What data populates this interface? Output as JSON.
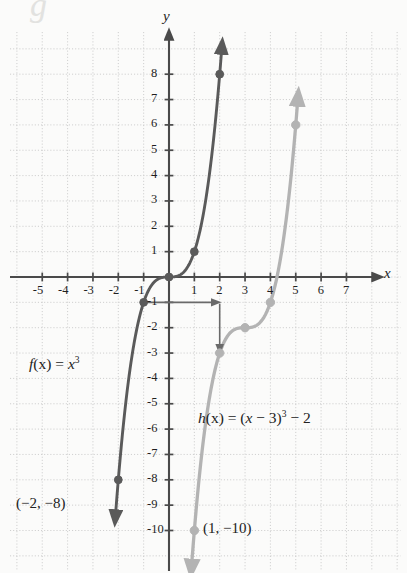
{
  "figure": {
    "axis_labels": {
      "x": "x",
      "y": "y"
    },
    "x_ticks": [
      "-5",
      "-4",
      "-3",
      "-2",
      "-1",
      "1",
      "2",
      "3",
      "4",
      "5",
      "6",
      "7"
    ],
    "y_ticks": [
      "8",
      "7",
      "6",
      "5",
      "4",
      "3",
      "2",
      "1",
      "-1",
      "-2",
      "-3",
      "-4",
      "-5",
      "-6",
      "-7",
      "-8",
      "-9",
      "-10"
    ],
    "function_labels": {
      "f_name": "f",
      "f_arg": "(x) = ",
      "f_base": "x",
      "f_exp": "3",
      "h_name": "h",
      "h_arg": "(x) = (",
      "h_var": "x",
      "h_mid": " − 3)",
      "h_exp": "3",
      "h_tail": " − 2"
    },
    "point_labels": {
      "f_endpoint": "(−2, −8)",
      "h_endpoint": "(1, −10)"
    },
    "colors": {
      "f_curve": "#5a5a5a",
      "h_curve": "#b3b3b3",
      "axis": "#4a4a4a",
      "grid": "#c9c9c9",
      "transform_arrow": "#6a6a6a"
    }
  },
  "chart_data": {
    "type": "line",
    "title": "",
    "xlabel": "x",
    "ylabel": "y",
    "xlim": [
      -6.3,
      7.9
    ],
    "ylim": [
      -10.8,
      9.1
    ],
    "grid": true,
    "legend": "inline-annotations",
    "series": [
      {
        "name": "f(x) = x^3",
        "color": "#5a5a5a",
        "marked_points": [
          {
            "x": -2,
            "y": -8,
            "label": "(-2, -8)"
          },
          {
            "x": -1,
            "y": -1,
            "label": ""
          },
          {
            "x": 0,
            "y": 0,
            "label": ""
          },
          {
            "x": 1,
            "y": 1,
            "label": ""
          },
          {
            "x": 2,
            "y": 8,
            "label": ""
          }
        ],
        "x": [
          -2.05,
          -1.9,
          -1.75,
          -1.6,
          -1.45,
          -1.3,
          -1.15,
          -1,
          -0.85,
          -0.7,
          -0.55,
          -0.4,
          -0.25,
          -0.1,
          0,
          0.1,
          0.25,
          0.4,
          0.55,
          0.7,
          0.85,
          1,
          1.15,
          1.3,
          1.45,
          1.6,
          1.75,
          1.9,
          2.05
        ],
        "y": [
          -8.6,
          -6.86,
          -5.36,
          -4.1,
          -3.05,
          -2.2,
          -1.52,
          -1,
          -0.61,
          -0.34,
          -0.17,
          -0.06,
          -0.02,
          0,
          0,
          0,
          0.02,
          0.06,
          0.17,
          0.34,
          0.61,
          1,
          1.52,
          2.2,
          3.05,
          4.1,
          5.36,
          6.86,
          8.6
        ],
        "arrows": [
          "start",
          "end"
        ]
      },
      {
        "name": "h(x) = (x - 3)^3 - 2",
        "color": "#b3b3b3",
        "marked_points": [
          {
            "x": 1,
            "y": -10,
            "label": "(1, -10)"
          },
          {
            "x": 2,
            "y": -3,
            "label": ""
          },
          {
            "x": 3,
            "y": -2,
            "label": ""
          },
          {
            "x": 4,
            "y": -1,
            "label": ""
          },
          {
            "x": 5,
            "y": 6,
            "label": ""
          }
        ],
        "x": [
          0.95,
          1.1,
          1.25,
          1.4,
          1.55,
          1.7,
          1.85,
          2,
          2.15,
          2.3,
          2.45,
          2.6,
          2.75,
          2.9,
          3,
          3.1,
          3.25,
          3.4,
          3.55,
          3.7,
          3.85,
          4,
          4.15,
          4.3,
          4.45,
          4.6,
          4.75,
          4.9,
          5.05
        ],
        "y": [
          -10.6,
          -8.86,
          -7.36,
          -6.1,
          -5.05,
          -4.2,
          -3.52,
          -3,
          -2.61,
          -2.34,
          -2.17,
          -2.06,
          -2.02,
          -2,
          -2,
          -2,
          -1.98,
          -1.94,
          -1.83,
          -1.66,
          -1.39,
          -1,
          -0.48,
          0.2,
          1.05,
          2.1,
          3.36,
          4.86,
          6.6
        ],
        "arrows": [
          "start",
          "end"
        ]
      }
    ],
    "annotations": [
      {
        "kind": "text",
        "text": "f(x) = x^3",
        "x": -4.0,
        "y": -3.6
      },
      {
        "kind": "text",
        "text": "h(x) = (x - 3)^3 - 2",
        "x": 1.1,
        "y": -5.4
      },
      {
        "kind": "text",
        "text": "(-2, -8)",
        "x": -5.7,
        "y": -8.45
      },
      {
        "kind": "text",
        "text": "(1, -10)",
        "x": 1.45,
        "y": -9.45
      },
      {
        "kind": "arrow",
        "desc": "mapping-arrow",
        "path": [
          [
            -1,
            -1
          ],
          [
            2,
            -1
          ],
          [
            2,
            -3
          ]
        ]
      }
    ]
  }
}
